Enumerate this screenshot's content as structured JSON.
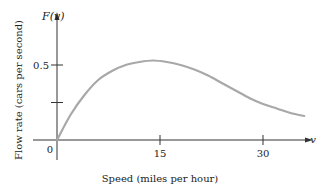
{
  "chart_data": {
    "type": "line",
    "title": "",
    "xlabel": "Speed (miles per hour)",
    "ylabel": "Flow rate (cars per second)",
    "x_axis_symbol": "v",
    "y_axis_symbol": "F(v)",
    "origin_label": "0",
    "x_ticks": [
      15,
      30
    ],
    "x_tick_labels": [
      "15",
      "30"
    ],
    "y_ticks": [
      0.25,
      0.5
    ],
    "y_tick_labels": [
      "",
      "0.5"
    ],
    "xlim": [
      0,
      37
    ],
    "ylim": [
      0,
      0.7
    ],
    "grid": false,
    "series": [
      {
        "name": "F(v)",
        "color": "#a8a8a8",
        "x": [
          0,
          2,
          4,
          6,
          8,
          10,
          12,
          14,
          16,
          18,
          20,
          22,
          24,
          26,
          28,
          30,
          32,
          34,
          36
        ],
        "y": [
          0,
          0.17,
          0.3,
          0.4,
          0.46,
          0.5,
          0.52,
          0.53,
          0.52,
          0.5,
          0.47,
          0.43,
          0.38,
          0.33,
          0.28,
          0.24,
          0.21,
          0.18,
          0.16
        ]
      }
    ]
  }
}
